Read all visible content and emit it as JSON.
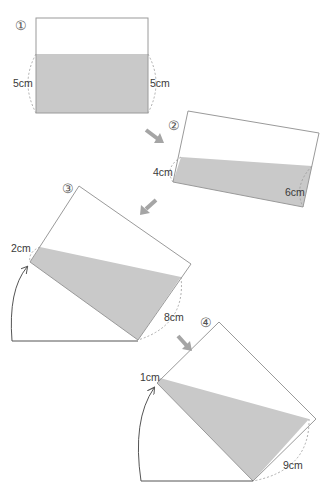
{
  "diagram": {
    "colors": {
      "water": "#c9c9c9",
      "outline": "#8a8a8a",
      "arrow": "#9a9a9a",
      "text": "#3a3a3a"
    },
    "steps": [
      {
        "id": "1",
        "marker": "①",
        "labels": {
          "left": "5cm",
          "right": "5cm"
        }
      },
      {
        "id": "2",
        "marker": "②",
        "labels": {
          "left": "4cm",
          "right": "6cm"
        }
      },
      {
        "id": "3",
        "marker": "③",
        "labels": {
          "left": "2cm",
          "right": "8cm"
        }
      },
      {
        "id": "4",
        "marker": "④",
        "labels": {
          "left": "1cm",
          "right": "9cm"
        }
      }
    ],
    "transition_arrows": [
      "arrow-1-to-2",
      "arrow-2-to-3",
      "arrow-3-to-4"
    ]
  }
}
